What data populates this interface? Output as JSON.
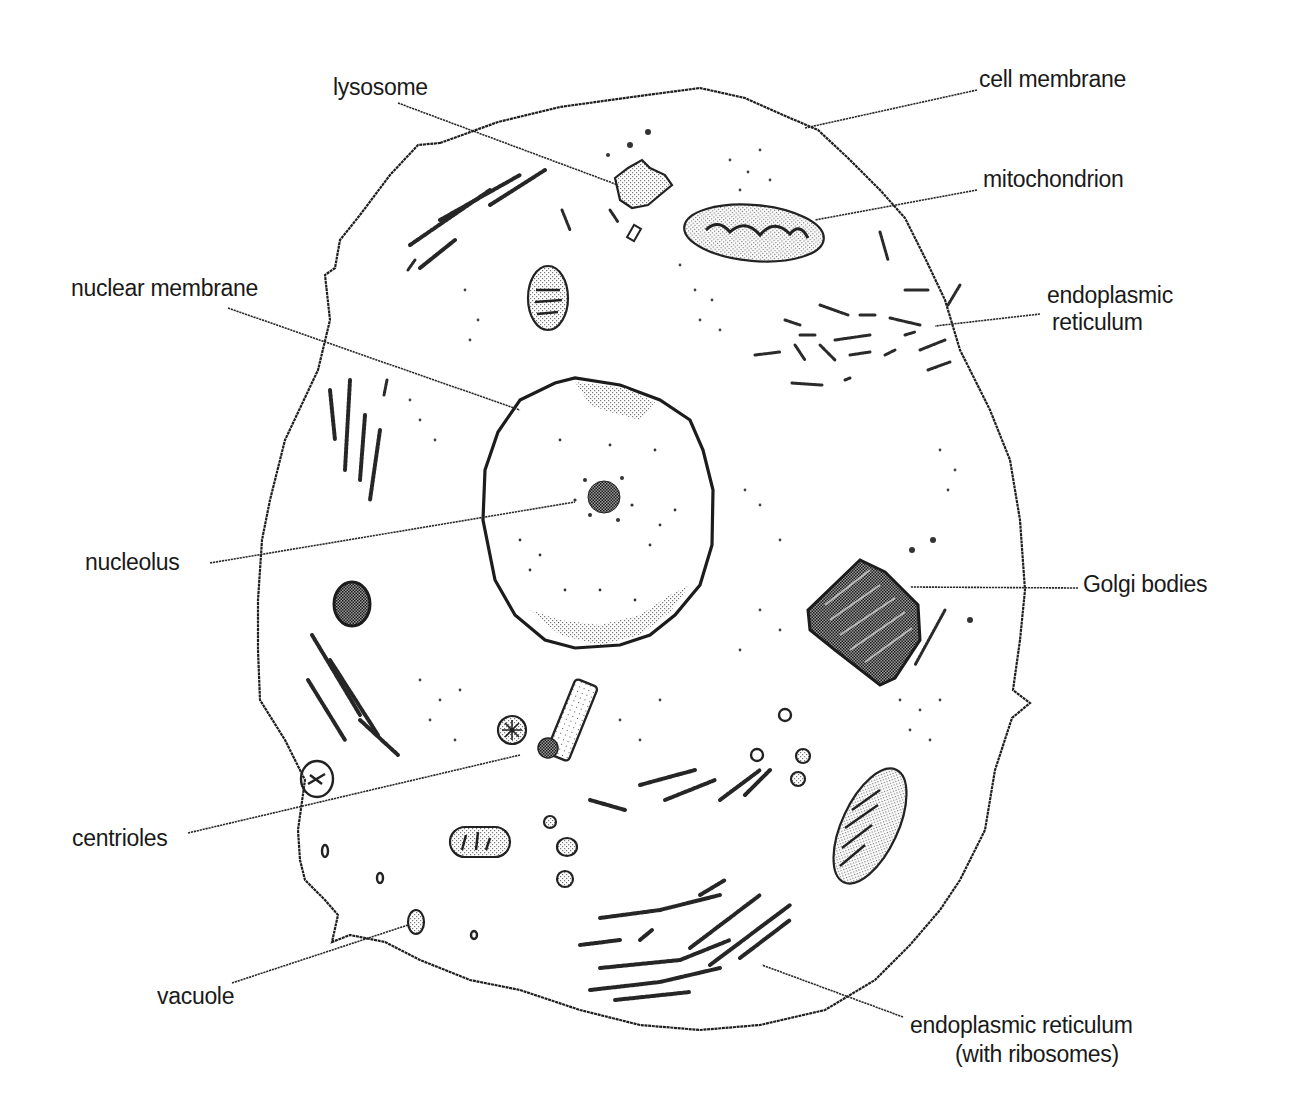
{
  "diagram": {
    "type": "labeled-illustration",
    "style": "black-and-white stippled line drawing",
    "colors": {
      "background": "#ffffff",
      "ink": "#1f1f1f"
    }
  },
  "labels": {
    "lysosome": "lysosome",
    "cell_membrane": "cell membrane",
    "mitochondrion": "mitochondrion",
    "endoplasmic_reticulum_line1": "endoplasmic",
    "endoplasmic_reticulum_line2": "reticulum",
    "nuclear_membrane": "nuclear membrane",
    "nucleolus": "nucleolus",
    "golgi_bodies": "Golgi bodies",
    "centrioles": "centrioles",
    "vacuole": "vacuole",
    "rough_er_line1": "endoplasmic reticulum",
    "rough_er_line2": "(with ribosomes)"
  },
  "annotations": [
    {
      "label": "lysosome",
      "side": "top-left",
      "points_to": "lysosome"
    },
    {
      "label": "cell membrane",
      "side": "top-right",
      "points_to": "cell membrane"
    },
    {
      "label": "mitochondrion",
      "side": "right",
      "points_to": "upper mitochondrion"
    },
    {
      "label": "endoplasmic reticulum",
      "side": "right",
      "points_to": "smooth ER cluster"
    },
    {
      "label": "nuclear membrane",
      "side": "left",
      "points_to": "nucleus outer edge"
    },
    {
      "label": "nucleolus",
      "side": "left",
      "points_to": "nucleolus in nucleus"
    },
    {
      "label": "Golgi bodies",
      "side": "right",
      "points_to": "Golgi stack"
    },
    {
      "label": "centrioles",
      "side": "left",
      "points_to": "centriole cylinder"
    },
    {
      "label": "vacuole",
      "side": "bottom-left",
      "points_to": "small vacuole"
    },
    {
      "label": "endoplasmic reticulum (with ribosomes)",
      "side": "bottom-right",
      "points_to": "rough ER cluster"
    }
  ]
}
